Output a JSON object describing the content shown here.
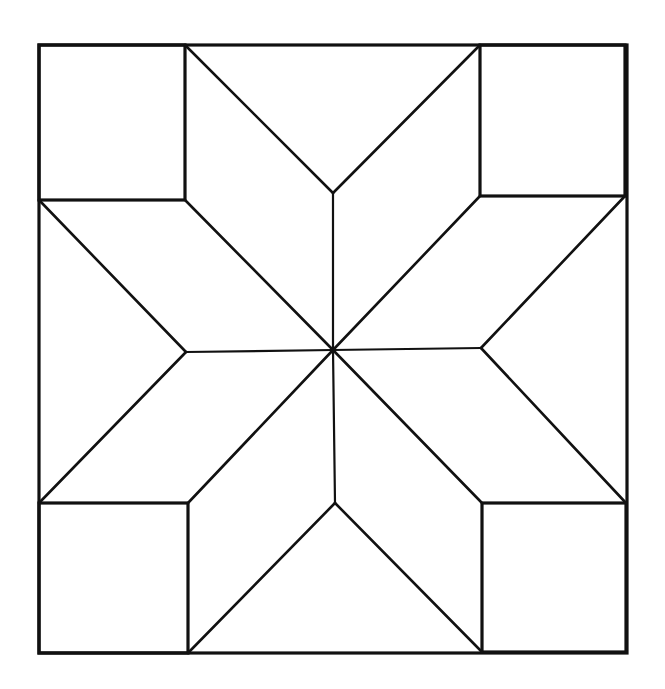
{
  "diagram": {
    "type": "quilt-block-pattern",
    "pattern": "eight-pointed-star",
    "line_color": "#111111",
    "background_color": "#ffffff",
    "outer_square": {
      "x1": 39,
      "y1": 45,
      "x2": 627,
      "y2": 653
    },
    "center": {
      "x": 333,
      "y": 350
    },
    "corner_squares": [
      {
        "name": "top-left",
        "x1": 39,
        "y1": 45,
        "x2": 185,
        "y2": 200
      },
      {
        "name": "top-right",
        "x1": 480,
        "y1": 45,
        "x2": 625,
        "y2": 196
      },
      {
        "name": "bottom-left",
        "x1": 39,
        "y1": 503,
        "x2": 188,
        "y2": 653
      },
      {
        "name": "bottom-right",
        "x1": 482,
        "y1": 503,
        "x2": 626,
        "y2": 652
      }
    ],
    "inner_points": {
      "top": {
        "x": 333,
        "y": 193
      },
      "bottom": {
        "x": 335,
        "y": 503
      },
      "left": {
        "x": 186,
        "y": 352
      },
      "right": {
        "x": 481,
        "y": 348
      }
    },
    "segments": [
      {
        "id": "diamond-top-left-outer",
        "x1": 185,
        "y1": 45,
        "x2": 333,
        "y2": 193
      },
      {
        "id": "diamond-top-right-outer",
        "x1": 480,
        "y1": 45,
        "x2": 333,
        "y2": 193
      },
      {
        "id": "vertical-top",
        "x1": 333,
        "y1": 193,
        "x2": 333,
        "y2": 350
      },
      {
        "id": "vertical-bottom",
        "x1": 333,
        "y1": 350,
        "x2": 335,
        "y2": 503
      },
      {
        "id": "horizontal-left",
        "x1": 186,
        "y1": 352,
        "x2": 333,
        "y2": 350
      },
      {
        "id": "horizontal-right",
        "x1": 333,
        "y1": 350,
        "x2": 481,
        "y2": 348
      },
      {
        "id": "diag-center-to-top-left",
        "x1": 333,
        "y1": 350,
        "x2": 185,
        "y2": 200
      },
      {
        "id": "diag-center-to-top-right",
        "x1": 333,
        "y1": 350,
        "x2": 480,
        "y2": 196
      },
      {
        "id": "diag-center-to-bottom-left",
        "x1": 333,
        "y1": 350,
        "x2": 188,
        "y2": 503
      },
      {
        "id": "diag-center-to-bottom-right",
        "x1": 333,
        "y1": 350,
        "x2": 482,
        "y2": 503
      },
      {
        "id": "left-upper-diag",
        "x1": 39,
        "y1": 200,
        "x2": 186,
        "y2": 352
      },
      {
        "id": "left-lower-diag",
        "x1": 186,
        "y1": 352,
        "x2": 39,
        "y2": 503
      },
      {
        "id": "right-upper-diag",
        "x1": 625,
        "y1": 196,
        "x2": 481,
        "y2": 348
      },
      {
        "id": "right-lower-diag",
        "x1": 481,
        "y1": 348,
        "x2": 626,
        "y2": 503
      },
      {
        "id": "bottom-left-diag",
        "x1": 188,
        "y1": 653,
        "x2": 335,
        "y2": 503
      },
      {
        "id": "bottom-right-diag",
        "x1": 335,
        "y1": 503,
        "x2": 482,
        "y2": 652
      }
    ]
  }
}
